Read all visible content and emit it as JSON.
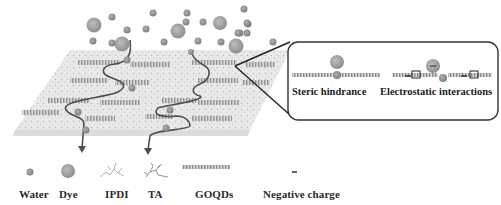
{
  "figure": {
    "colors": {
      "background": "#ffffff",
      "membrane": "#e4e4e4",
      "particle_water": "#9a9a9a",
      "particle_dye": "#a8a8a8",
      "water_path": "#555555",
      "text": "#2a2a2a",
      "inset_border": "#333333"
    }
  },
  "inset": {
    "mechanisms": [
      {
        "label": "Steric hindrance"
      },
      {
        "label": "Electrostatic interactions"
      }
    ],
    "charge_symbol": "−"
  },
  "legend": {
    "items": [
      {
        "label": "Water",
        "icon": "small-gray-circle"
      },
      {
        "label": "Dye",
        "icon": "large-gray-circle"
      },
      {
        "label": "IPDI",
        "icon": "branched-molecule"
      },
      {
        "label": "TA",
        "icon": "bushy-molecule"
      },
      {
        "label": "GOQDs",
        "icon": "striped-sheet"
      },
      {
        "label": "Negative charge",
        "icon": "minus-sign",
        "symbol": "−"
      }
    ]
  },
  "particles_above": {
    "dye": [
      [
        94,
        25
      ],
      [
        122,
        44
      ],
      [
        178,
        31
      ],
      [
        230,
        42
      ],
      [
        278,
        30
      ],
      [
        216,
        10
      ],
      [
        313,
        12
      ]
    ],
    "water": [
      [
        111,
        17
      ],
      [
        127,
        29
      ],
      [
        93,
        40
      ],
      [
        112,
        42
      ],
      [
        153,
        12
      ],
      [
        146,
        29
      ],
      [
        164,
        38
      ],
      [
        186,
        22
      ],
      [
        191,
        13
      ],
      [
        197,
        40
      ],
      [
        221,
        22
      ],
      [
        221,
        36
      ],
      [
        242,
        6
      ],
      [
        240,
        20
      ],
      [
        247,
        33
      ],
      [
        252,
        24
      ],
      [
        236,
        42
      ],
      [
        270,
        17
      ]
    ]
  }
}
